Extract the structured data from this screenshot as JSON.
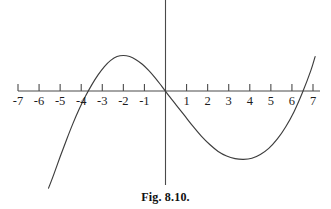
{
  "caption": "Fig. 8.10.",
  "chart_data": {
    "type": "line",
    "title": "",
    "subtitle": "",
    "xlabel": "",
    "ylabel": "",
    "grid": false,
    "legend": "none",
    "xlim": [
      -7,
      7
    ],
    "ylim": [
      -6.4,
      4.6
    ],
    "xticks": [
      -7,
      -6,
      -5,
      -4,
      -3,
      -2,
      -1,
      1,
      2,
      3,
      4,
      5,
      6,
      7
    ],
    "xtick_labels": [
      "-7",
      "-6",
      "-5",
      "-4",
      "-3",
      "-2",
      "-1",
      "1",
      "2",
      "3",
      "4",
      "5",
      "6",
      "7"
    ],
    "yticks": [],
    "ytick_labels": [],
    "axis_color": "#4a4a4a",
    "curve_color": "#3d3d3d",
    "roots": [
      -4.0,
      0.0,
      6.5
    ],
    "local_maximum": {
      "x": -2.1,
      "y": 2.3
    },
    "local_minimum": {
      "x": 4.1,
      "y": -4.4
    },
    "series": [
      {
        "name": "cubic",
        "x": [
          -5.55,
          -5.3,
          -5.0,
          -4.7,
          -4.4,
          -4.1,
          -3.8,
          -3.5,
          -3.2,
          -2.9,
          -2.6,
          -2.3,
          -2.0,
          -1.7,
          -1.4,
          -1.1,
          -0.8,
          -0.5,
          -0.2,
          0.1,
          0.5,
          0.9,
          1.3,
          1.7,
          2.1,
          2.5,
          2.9,
          3.3,
          3.7,
          4.1,
          4.5,
          4.9,
          5.3,
          5.7,
          6.1,
          6.5,
          6.9,
          7.1
        ],
        "y": [
          -6.35,
          -5.45,
          -4.3,
          -3.2,
          -2.15,
          -1.2,
          -0.35,
          0.4,
          1.05,
          1.6,
          2.0,
          2.25,
          2.32,
          2.25,
          2.05,
          1.75,
          1.35,
          0.88,
          0.35,
          -0.2,
          -0.9,
          -1.6,
          -2.3,
          -2.95,
          -3.5,
          -3.95,
          -4.25,
          -4.42,
          -4.47,
          -4.4,
          -4.15,
          -3.75,
          -3.15,
          -2.35,
          -1.35,
          -0.1,
          1.35,
          2.25
        ]
      }
    ]
  }
}
